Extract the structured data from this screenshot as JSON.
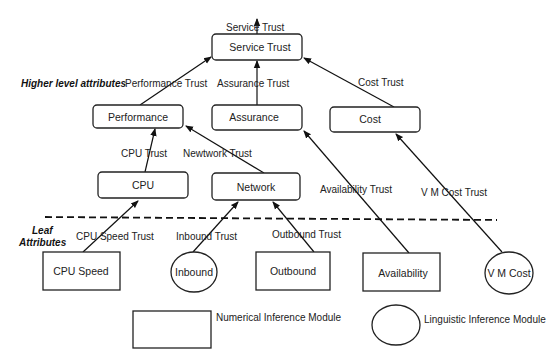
{
  "diagram": {
    "section_labels": {
      "higher": "Higher level attributes",
      "leaf_line1": "Leaf",
      "leaf_line2": "Attributes"
    },
    "nodes": {
      "service_trust": "Service Trust",
      "performance": "Performance",
      "assurance": "Assurance",
      "cost": "Cost",
      "cpu": "CPU",
      "network": "Network",
      "cpu_speed": "CPU Speed",
      "inbound": "Inbound",
      "outbound": "Outbound",
      "availability": "Availability",
      "vm_cost": "V M Cost"
    },
    "edges": {
      "service_trust_out": "Service Trust",
      "performance_trust": "Performance Trust",
      "assurance_trust": "Assurance Trust",
      "cost_trust": "Cost Trust",
      "cpu_trust": "CPU Trust",
      "network_trust": "Newtwork Trust",
      "availability_trust": "Availability Trust",
      "vm_cost_trust": "V M Cost Trust",
      "cpu_speed_trust": "CPU Speed Trust",
      "inbound_trust": "Inbound Trust",
      "outbound_trust": "Outbound Trust"
    },
    "legend": {
      "numerical": "Numerical Inference Module",
      "linguistic": "Linguistic Inference Module"
    },
    "colors": {
      "stroke": "#222222",
      "background": "#ffffff"
    }
  }
}
